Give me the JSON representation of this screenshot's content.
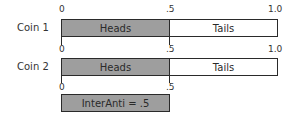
{
  "ticks": {
    "zero": "0",
    "half": ".5",
    "one": "1.0"
  },
  "rows": [
    {
      "label": "Coin 1",
      "heads": "Heads",
      "tails": "Tails"
    },
    {
      "label": "Coin 2",
      "heads": "Heads",
      "tails": "Tails"
    }
  ],
  "result": {
    "label": "InterAnti = .5"
  },
  "colors": {
    "heads_fill": "#9e9e9e",
    "tails_fill": "#ffffff",
    "stroke": "#2a2a2a"
  }
}
